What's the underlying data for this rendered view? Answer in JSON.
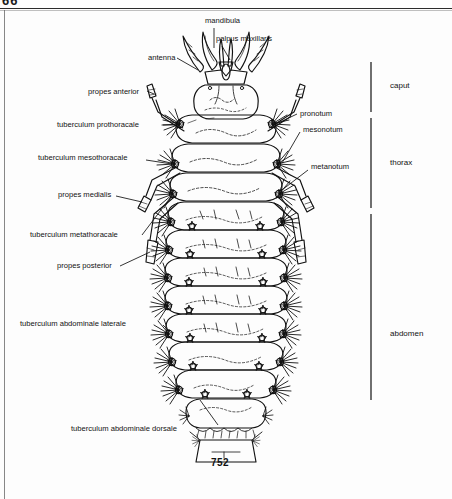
{
  "page": {
    "running_number": "66",
    "figure_number": "752",
    "background_color": "#fcfcfc",
    "ink_color": "#111111"
  },
  "figure": {
    "caption": "752"
  },
  "callouts": {
    "top": [
      {
        "id": "mandibula",
        "label": "mandibula",
        "x": 205,
        "y": 22,
        "leader": "vertical"
      },
      {
        "id": "palpus-maxillaris",
        "label": "palpus maxillaris",
        "x": 216,
        "y": 40,
        "leader": "diagonal"
      }
    ],
    "left": [
      {
        "id": "antenna",
        "label": "antenna",
        "x": 148,
        "y": 59
      },
      {
        "id": "propes-anterior",
        "label": "propes anterior",
        "x": 88,
        "y": 93
      },
      {
        "id": "tuberculum-prothoracale",
        "label": "tuberculum prothoracale",
        "x": 57,
        "y": 126
      },
      {
        "id": "tuberculum-mesothoracale",
        "label": "tuberculum mesothoracale",
        "x": 38,
        "y": 159
      },
      {
        "id": "propes-medialis",
        "label": "propes medialis",
        "x": 60,
        "y": 196
      },
      {
        "id": "tuberculum-metathoracale",
        "label": "tuberculum metathoracale",
        "x": 30,
        "y": 236
      },
      {
        "id": "propes-posterior",
        "label": "propes posterior",
        "x": 57,
        "y": 267
      },
      {
        "id": "tuberculum-abdominale-laterale",
        "label": "tuberculum abdominale laterale",
        "x": 20,
        "y": 325
      },
      {
        "id": "tuberculum-abdominale-dorsale",
        "label": "tuberculum abdominale dorsale",
        "x": 71,
        "y": 430
      }
    ],
    "right": [
      {
        "id": "pronotum",
        "label": "pronotum",
        "x": 300,
        "y": 115
      },
      {
        "id": "mesonotum",
        "label": "mesonotum",
        "x": 303,
        "y": 131
      },
      {
        "id": "metanotum",
        "label": "metanotum",
        "x": 311,
        "y": 168
      }
    ]
  },
  "regions": [
    {
      "id": "caput",
      "label": "caput",
      "x": 390,
      "y": 86,
      "bracket_top": 62,
      "bracket_bottom": 112
    },
    {
      "id": "thorax",
      "label": "thorax",
      "x": 390,
      "y": 163,
      "bracket_top": 118,
      "bracket_bottom": 208
    },
    {
      "id": "abdomen",
      "label": "abdomen",
      "x": 390,
      "y": 334,
      "bracket_top": 214,
      "bracket_bottom": 400
    }
  ]
}
